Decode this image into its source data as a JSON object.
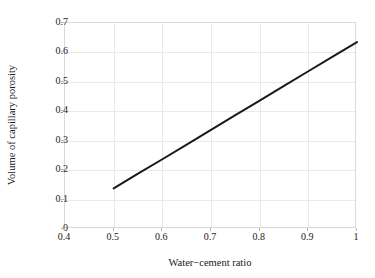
{
  "chart_data": {
    "type": "line",
    "title": "",
    "xlabel": "Water−cement ratio",
    "ylabel": "Volume of capillary porosity",
    "xlim": [
      0.4,
      1.0
    ],
    "ylim": [
      0.0,
      0.7
    ],
    "xticks": [
      "0.4",
      "0.5",
      "0.6",
      "0.7",
      "0.8",
      "0.9",
      "1"
    ],
    "xtick_values": [
      0.4,
      0.5,
      0.6,
      0.7,
      0.8,
      0.9,
      1.0
    ],
    "yticks": [
      "0",
      "0.1",
      "0.2",
      "0.3",
      "0.4",
      "0.5",
      "0.6",
      "0.7"
    ],
    "ytick_values": [
      0.0,
      0.1,
      0.2,
      0.3,
      0.4,
      0.5,
      0.6,
      0.7
    ],
    "grid": true,
    "legend": "none",
    "line_color": "#1a1a1a",
    "grid_color": "#e9e9e9",
    "axis_color": "#d9d9d9",
    "background": "#ffffff",
    "line_width": 2,
    "series": [
      {
        "name": "Capillary porosity",
        "x": [
          0.5,
          0.55,
          0.6,
          0.65,
          0.7,
          0.75,
          0.8,
          0.85,
          0.9,
          0.95,
          1.0
        ],
        "values": [
          0.138,
          0.188,
          0.237,
          0.287,
          0.337,
          0.387,
          0.436,
          0.486,
          0.536,
          0.586,
          0.635
        ]
      }
    ],
    "annotations": []
  }
}
